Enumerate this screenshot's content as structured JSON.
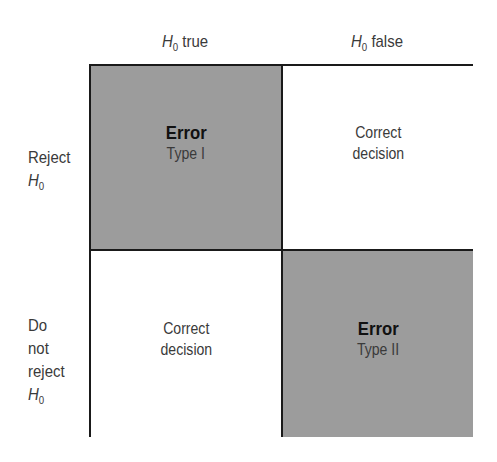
{
  "diagram": {
    "type": "2x2 decision matrix",
    "columns": [
      {
        "symbol": "H",
        "subscript": "0",
        "label": "true"
      },
      {
        "symbol": "H",
        "subscript": "0",
        "label": "false"
      }
    ],
    "rows": [
      {
        "lines": [
          "Reject"
        ],
        "symbol": "H",
        "subscript": "0"
      },
      {
        "lines": [
          "Do",
          "not",
          "reject"
        ],
        "symbol": "H",
        "subscript": "0"
      }
    ],
    "cells": [
      [
        {
          "title": "Error",
          "subtitle": "Type I",
          "shaded": true
        },
        {
          "line1": "Correct",
          "line2": "decision",
          "shaded": false
        }
      ],
      [
        {
          "line1": "Correct",
          "line2": "decision",
          "shaded": false
        },
        {
          "title": "Error",
          "subtitle": "Type II",
          "shaded": true
        }
      ]
    ],
    "colors": {
      "shaded": "#9c9c9c",
      "plain": "#ffffff",
      "border": "#1a1a1a"
    }
  }
}
